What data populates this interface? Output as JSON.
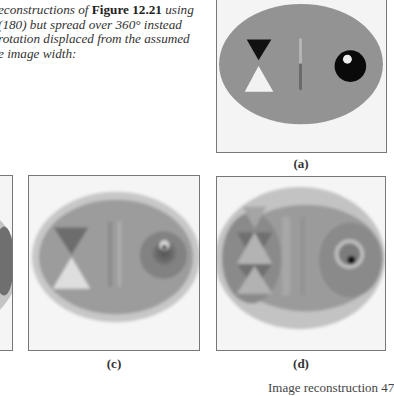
{
  "caption": {
    "line1_pre": "econstructions of ",
    "line1_bold": "Figure 12.21",
    "line1_post": " using",
    "line2": "(180) but spread over 360° instead",
    "line3": "rotation displaced from the assumed",
    "line4": "e image width:"
  },
  "panels": [
    {
      "id": "a",
      "label": "(a)"
    },
    {
      "id": "b",
      "label": ""
    },
    {
      "id": "c",
      "label": "(c)"
    },
    {
      "id": "d",
      "label": "(d)"
    }
  ],
  "footer": {
    "text": "Image reconstruction  47"
  },
  "colors": {
    "frame": "#777777",
    "background": "#f6f6f6",
    "outer_ellipse": "#c4c4c4",
    "inner_ellipse": "#9a9a9a",
    "dark_feature": "#111111",
    "light_feature": "#f2f2f2"
  }
}
